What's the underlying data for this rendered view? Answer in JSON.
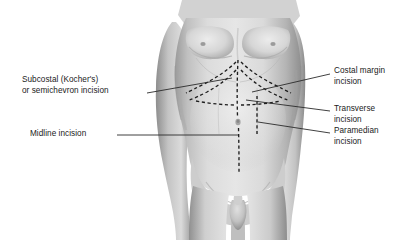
{
  "illustration": {
    "title": "Abdominal surgical incisions",
    "subject": "male-torso-anterior-view",
    "palette": {
      "background": "#ffffff",
      "skin_light": "#e2e2e2",
      "skin_mid": "#c9c9c9",
      "skin_shadow": "#9e9e9e",
      "skin_deep_shadow": "#7d7d7d",
      "incision_line": "#1f1f1f",
      "leader_line": "#2a2a2a",
      "text": "#1a1a1a"
    }
  },
  "labels": {
    "left": [
      {
        "id": "subcostal",
        "lines": [
          "Subcostal (Kocher's)",
          "or semichevron incision"
        ],
        "x": 22,
        "y": 76
      },
      {
        "id": "midline",
        "lines": [
          "Midline incision"
        ],
        "x": 30,
        "y": 128
      }
    ],
    "right": [
      {
        "id": "costal-margin",
        "lines": [
          "Costal margin",
          "incision"
        ],
        "x": 333,
        "y": 66
      },
      {
        "id": "transverse",
        "lines": [
          "Transverse",
          "incision"
        ],
        "x": 333,
        "y": 104
      },
      {
        "id": "paramedian",
        "lines": [
          "Paramedian",
          "incision"
        ],
        "x": 333,
        "y": 127
      }
    ]
  },
  "incisions": [
    {
      "id": "midline-dashed",
      "orientation": "vertical",
      "description": "midline vertical dashed line from xiphoid to pubis"
    },
    {
      "id": "subcostal-chevron-left",
      "orientation": "oblique",
      "description": "left subcostal chevron dashed curve"
    },
    {
      "id": "subcostal-chevron-right",
      "orientation": "oblique",
      "description": "right subcostal chevron dashed curve"
    },
    {
      "id": "costal-margin-dashed",
      "orientation": "oblique",
      "description": "right costal margin dashed curve"
    },
    {
      "id": "transverse-dashed",
      "orientation": "horizontal",
      "description": "transverse dashed line across upper abdomen"
    },
    {
      "id": "paramedian-dashed",
      "orientation": "vertical",
      "description": "right paramedian vertical dashed line"
    }
  ]
}
